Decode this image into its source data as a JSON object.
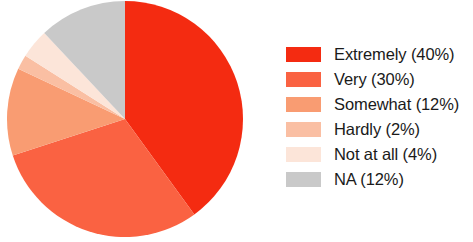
{
  "chart_data": {
    "type": "pie",
    "title": "",
    "labels": [
      "Extremely",
      "Very",
      "Somewhat",
      "Hardly",
      "Not at all",
      "NA"
    ],
    "values": [
      40,
      30,
      12,
      2,
      4,
      12
    ],
    "value_unit": "%",
    "colors": [
      "#F42B11",
      "#FA6242",
      "#F99C72",
      "#FABFA3",
      "#FCE5D9",
      "#C9C9C9"
    ],
    "start_angle_deg": 0,
    "direction": "clockwise",
    "legend_position": "right",
    "legend_entries": [
      {
        "label": "Extremely (40%)",
        "color": "#F42B11",
        "swatch_name": "legend-swatch-extremely"
      },
      {
        "label": "Very (30%)",
        "color": "#FA6242",
        "swatch_name": "legend-swatch-very"
      },
      {
        "label": "Somewhat (12%)",
        "color": "#F99C72",
        "swatch_name": "legend-swatch-somewhat"
      },
      {
        "label": "Hardly (2%)",
        "color": "#FABFA3",
        "swatch_name": "legend-swatch-hardly"
      },
      {
        "label": "Not at all (4%)",
        "color": "#FCE5D9",
        "swatch_name": "legend-swatch-not-at-all"
      },
      {
        "label": "NA (12%)",
        "color": "#C9C9C9",
        "swatch_name": "legend-swatch-na"
      }
    ],
    "grid": false,
    "xlabel": "",
    "ylabel": ""
  },
  "figure": {
    "background_color": "#FFFFFF",
    "pie_center_x": 125,
    "pie_center_y": 119,
    "pie_radius": 118
  }
}
